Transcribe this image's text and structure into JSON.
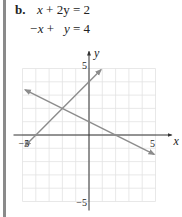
{
  "problem": {
    "label": "b.",
    "equations": [
      {
        "lhs_a": "x",
        "op": "+",
        "lhs_b": "2y",
        "rhs": "2"
      },
      {
        "lhs_a": "−x",
        "op": "+",
        "lhs_b": "y",
        "rhs": "4"
      }
    ]
  },
  "chart_data": {
    "type": "line",
    "title": "",
    "xlabel": "x",
    "ylabel": "y",
    "xlim": [
      -5,
      5
    ],
    "ylim": [
      -5,
      5
    ],
    "grid": true,
    "grid_step": 1,
    "tick_labels": {
      "x": [
        {
          "value": -5,
          "label": "−5"
        },
        {
          "value": 5,
          "label": "5"
        }
      ],
      "y": [
        {
          "value": 5,
          "label": "5"
        },
        {
          "value": -5,
          "label": "−5"
        }
      ]
    },
    "series": [
      {
        "name": "x + 2y = 2",
        "x": [
          -4.8,
          4.9
        ],
        "y": [
          3.4,
          -1.45
        ],
        "arrows": "both"
      },
      {
        "name": "−x + y = 4",
        "x": [
          -4.8,
          0.9
        ],
        "y": [
          -0.8,
          4.9
        ],
        "arrows": "both"
      }
    ],
    "intersection": {
      "x": -2,
      "y": 2
    },
    "colors": {
      "lines": "#8c8c8c",
      "axes": "#333333",
      "grid": "#e2e2e2"
    }
  }
}
